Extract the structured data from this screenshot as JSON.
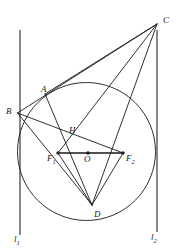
{
  "figure": {
    "width": 178,
    "height": 249,
    "stroke_color": "#1a1a1a",
    "background_color": "#ffffff",
    "line_width": 0.9
  },
  "circle": {
    "name": "main-circle",
    "cx": 86.5,
    "cy": 151.5,
    "r": 69.0,
    "stroke": "#1a1a1a",
    "fill": "none"
  },
  "points": [
    {
      "id": "A",
      "label": "A",
      "x": 45,
      "y": 94,
      "label_x": 41,
      "label_y": 85,
      "dot": false
    },
    {
      "id": "B",
      "label": "B",
      "x": 17.5,
      "y": 113,
      "label_x": 6,
      "label_y": 109,
      "dot": false
    },
    {
      "id": "C",
      "label": "C",
      "x": 157,
      "y": 24,
      "label_x": 163,
      "label_y": 17,
      "dot": false
    },
    {
      "id": "D",
      "label": "D",
      "x": 92,
      "y": 205,
      "label_x": 94,
      "label_y": 212,
      "dot": false
    },
    {
      "id": "H",
      "label": "H",
      "x": 64,
      "y": 132,
      "label_x": 69,
      "label_y": 127,
      "dot": false
    },
    {
      "id": "O",
      "label": "O",
      "x": 88,
      "y": 153,
      "label_x": 85,
      "label_y": 157,
      "dot": true
    },
    {
      "id": "F1",
      "label": "F",
      "sub": "1",
      "x": 58,
      "y": 153,
      "label_x": 48,
      "label_y": 156,
      "dot": true
    },
    {
      "id": "F2",
      "label": "F",
      "sub": "2",
      "x": 123,
      "y": 153,
      "label_x": 126,
      "label_y": 156,
      "dot": true
    }
  ],
  "vertical_lines": [
    {
      "id": "l1",
      "label": "l",
      "sub": "1",
      "x": 20,
      "y_top": 30,
      "y_bottom": 235,
      "label_x": 14,
      "label_y": 237,
      "stroke": "#6b6b6b"
    },
    {
      "id": "l2",
      "label": "l",
      "sub": "2",
      "x": 157,
      "y_top": 30,
      "y_bottom": 232,
      "label_x": 152,
      "label_y": 234,
      "stroke": "#6b6b6b"
    }
  ],
  "segments": [
    {
      "id": "B-C",
      "from": "B",
      "to": "C",
      "note": "chord through A extended to C"
    },
    {
      "id": "B-F2",
      "from": "B",
      "to": "F2",
      "note": "from B through H to F2"
    },
    {
      "id": "B-D",
      "from": "B",
      "to": "D",
      "note": "chord B to D"
    },
    {
      "id": "A-D",
      "from": "A",
      "to": "D",
      "note": "chord A to D through H"
    },
    {
      "id": "A-C",
      "from": "A",
      "to": "C",
      "note": "line A to C"
    },
    {
      "id": "C-F1",
      "from": "C",
      "to": "F1",
      "note": "line from C to F1 through circle"
    },
    {
      "id": "C-D",
      "from": "C",
      "to": "D",
      "note": "line from C to D through F2"
    },
    {
      "id": "F1-F2",
      "from": "F1",
      "to": "F2",
      "note": "focal axis segment through O"
    },
    {
      "id": "F1-D",
      "from": "F1",
      "to": "D",
      "note": "segment F1 to D"
    },
    {
      "id": "F2-D",
      "from": "F2",
      "to": "D",
      "note": "segment F2 to D"
    }
  ]
}
